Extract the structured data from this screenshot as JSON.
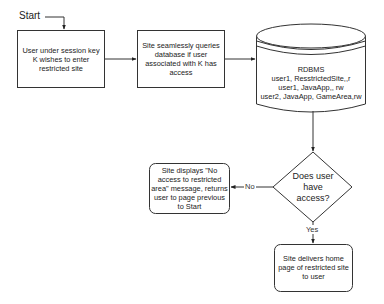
{
  "diagram": {
    "type": "flowchart",
    "start_label": "Start",
    "nodes": {
      "user_request": {
        "shape": "rectangle",
        "text": "User under session key K wishes to enter restricted site"
      },
      "query_db": {
        "shape": "rectangle",
        "text": "Site seamlessly queries database if user associated with K has access"
      },
      "database": {
        "shape": "cylinder",
        "title": "RDBMS",
        "rows": [
          "user1, ResstrictedSite,,r",
          "user1, JavaApp,, rw",
          "user2, JavaApp, GameArea,rw"
        ]
      },
      "decision": {
        "shape": "diamond",
        "text": "Does user have access?"
      },
      "denied": {
        "shape": "rounded-rectangle",
        "text": "Site displays \"No access to restricted area\" message, returns user to page previous to Start"
      },
      "granted": {
        "shape": "rounded-rectangle",
        "text": "Site delivers home page of restricted site to user"
      }
    },
    "edges": {
      "no_label": "No",
      "yes_label": "Yes"
    }
  }
}
